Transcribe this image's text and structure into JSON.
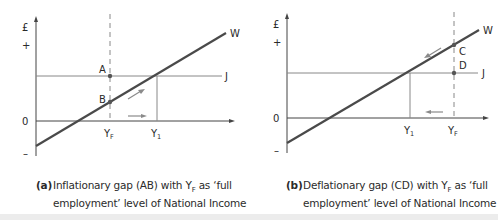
{
  "figure": {
    "panels": [
      {
        "id": "a",
        "y_axis_label": "£",
        "plus_label": "+",
        "minus_label": "–",
        "zero_label": "0",
        "curve_w_label": "W",
        "line_j_label": "J",
        "point_upper_label": "A",
        "point_lower_label": "B",
        "yf_label": "Y",
        "yf_sub": "F",
        "y1_label": "Y",
        "y1_sub": "1",
        "caption_tag": "(a)",
        "caption_line1_pre": "Inflationary gap (AB) with Y",
        "caption_line1_sub": "F",
        "caption_line1_post": " as ‘full",
        "caption_line2": "employment’ level of National Income"
      },
      {
        "id": "b",
        "y_axis_label": "£",
        "plus_label": "+",
        "minus_label": "–",
        "zero_label": "0",
        "curve_w_label": "W",
        "line_j_label": "J",
        "point_upper_label": "C",
        "point_lower_label": "D",
        "yf_label": "Y",
        "yf_sub": "F",
        "y1_label": "Y",
        "y1_sub": "1",
        "caption_tag": "(b)",
        "caption_line1_pre": "Deflationary gap (CD) with Y",
        "caption_line1_sub": "F",
        "caption_line1_post": " as ‘full",
        "caption_line2": "employment’ level of National Income"
      }
    ],
    "colors": {
      "axis": "#444444",
      "w_line": "#4a4a4a",
      "j_line": "#888888",
      "arrow": "#8a8a8a",
      "dash": "#888888"
    }
  }
}
